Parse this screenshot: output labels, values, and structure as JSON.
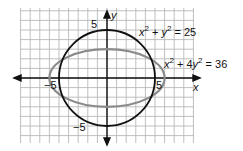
{
  "chart_data": {
    "type": "line",
    "title": "",
    "xlabel": "x",
    "ylabel": "y",
    "xlim": [
      -9,
      10
    ],
    "ylim": [
      -7,
      7
    ],
    "grid": true,
    "series": [
      {
        "name": "x^2 + y^2 = 25",
        "shape": "circle",
        "center": [
          0,
          0
        ],
        "radius": 5,
        "color": "#111111"
      },
      {
        "name": "x^2 + 4y^2 = 36",
        "shape": "ellipse",
        "center": [
          0,
          0
        ],
        "rx": 6,
        "ry": 3,
        "color": "#8a8a8a"
      }
    ],
    "annotations": {
      "x_pos": "5",
      "x_neg": "−5",
      "y_pos": "5",
      "y_neg": "−5"
    }
  },
  "labels": {
    "y_axis": "y",
    "x_axis": "x",
    "tick_y_pos": "5",
    "tick_y_neg": "−5",
    "tick_x_pos": "5",
    "tick_x_neg": "−5",
    "eq1_a": "x",
    "eq1_b": "2",
    "eq1_c": " + ",
    "eq1_d": "y",
    "eq1_e": "2",
    "eq1_f": " = 25",
    "eq2_a": "x",
    "eq2_b": "2",
    "eq2_c": " + 4",
    "eq2_d": "y",
    "eq2_e": "2",
    "eq2_f": " = 36"
  }
}
